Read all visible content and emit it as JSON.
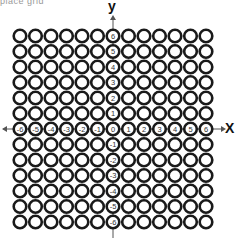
{
  "header": {
    "fragment": "place grid"
  },
  "axes": {
    "x_label": "X",
    "y_label": "y",
    "x_ticks": [
      "-6",
      "-5",
      "-4",
      "-3",
      "-2",
      "-1",
      "0",
      "1",
      "2",
      "3",
      "4",
      "5",
      "6"
    ],
    "y_ticks": [
      "6",
      "5",
      "4",
      "3",
      "2",
      "1",
      "0",
      "-1",
      "-2",
      "-3",
      "-4",
      "-5",
      "-6"
    ]
  },
  "grid": {
    "columns": 13,
    "rows": 13,
    "ring_color": "#1a1a1a",
    "background": "#ffffff"
  }
}
